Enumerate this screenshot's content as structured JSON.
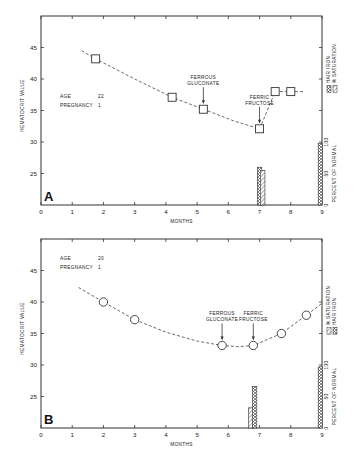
{
  "chart_data": [
    {
      "panel": "A",
      "type": "line",
      "xlabel": "MONTHS",
      "ylabel": "HEMATOCRIT VALUE",
      "y2label": "PERCENT OF NORMAL",
      "x_ticks": [
        "0",
        "1",
        "2",
        "3",
        "4",
        "5",
        "6",
        "7",
        "8",
        "9"
      ],
      "y_ticks": [
        "25",
        "30",
        "35",
        "40",
        "45"
      ],
      "y2_ticks": [
        "0",
        "50",
        "100"
      ],
      "xlim": [
        0,
        9
      ],
      "ylim": [
        20,
        50
      ],
      "y2lim": [
        0,
        100
      ],
      "marker": "square",
      "info": {
        "age_label": "AGE",
        "age_value": "22",
        "pregnancy_label": "PREGNANCY",
        "pregnancy_value": "1"
      },
      "series": [
        {
          "name": "Hematocrit",
          "x": [
            1.75,
            4.2,
            5.2,
            7.0,
            7.5,
            8.0
          ],
          "y": [
            43.2,
            37.1,
            35.2,
            32.1,
            38.0,
            38.0
          ]
        }
      ],
      "curve_path": [
        [
          1.3,
          44.5
        ],
        [
          1.75,
          43.2
        ],
        [
          3.0,
          40.0
        ],
        [
          4.2,
          37.1
        ],
        [
          5.2,
          35.2
        ],
        [
          6.2,
          33.3
        ],
        [
          7.0,
          32.1
        ],
        [
          7.5,
          38.0
        ],
        [
          8.0,
          38.0
        ],
        [
          8.4,
          38.0
        ]
      ],
      "annotations": [
        {
          "text_lines": [
            "FERROUS",
            "GLUCONATE"
          ],
          "x": 5.2,
          "y": 35.2
        },
        {
          "text_lines": [
            "FERRIC",
            "FRUCTOSE"
          ],
          "x": 7.0,
          "y": 32.1
        }
      ],
      "bars": [
        {
          "name": "HAIR IRON",
          "x": 7.0,
          "value": 60
        },
        {
          "name": "% SATURATION",
          "x": 7.1,
          "value": 55
        },
        {
          "name": "HAIR IRON",
          "x": 8.95,
          "value": 98
        }
      ],
      "legend": [
        "HAIR IRON",
        "% SATURATION"
      ],
      "grid": false
    },
    {
      "panel": "B",
      "type": "line",
      "xlabel": "MONTHS",
      "ylabel": "HEMATOCRIT VALUE",
      "y2label": "PERCENT OF NORMAL",
      "x_ticks": [
        "0",
        "1",
        "2",
        "3",
        "4",
        "5",
        "6",
        "7",
        "8",
        "9"
      ],
      "y_ticks": [
        "25",
        "30",
        "35",
        "40",
        "45"
      ],
      "y2_ticks": [
        "0",
        "50",
        "100"
      ],
      "xlim": [
        0,
        9
      ],
      "ylim": [
        20,
        50
      ],
      "y2lim": [
        0,
        100
      ],
      "marker": "circle",
      "info": {
        "age_label": "AGE",
        "age_value": "20",
        "pregnancy_label": "PREGNANCY",
        "pregnancy_value": "1"
      },
      "series": [
        {
          "name": "Hematocrit",
          "x": [
            2.0,
            3.0,
            5.8,
            6.8,
            7.7,
            8.5
          ],
          "y": [
            40.0,
            37.2,
            33.1,
            33.1,
            35.0,
            37.9
          ]
        }
      ],
      "curve_path": [
        [
          1.2,
          42.3
        ],
        [
          2.0,
          40.0
        ],
        [
          3.0,
          37.2
        ],
        [
          4.0,
          35.2
        ],
        [
          5.0,
          33.8
        ],
        [
          5.8,
          33.1
        ],
        [
          6.3,
          32.9
        ],
        [
          6.8,
          33.1
        ],
        [
          7.7,
          35.0
        ],
        [
          8.5,
          37.9
        ],
        [
          9.0,
          39.8
        ]
      ],
      "annotations": [
        {
          "text_lines": [
            "FERROUS",
            "GLUCONATE"
          ],
          "x": 5.8,
          "y": 33.1
        },
        {
          "text_lines": [
            "FERRIC",
            "FRUCTOSE"
          ],
          "x": 6.8,
          "y": 33.1
        }
      ],
      "bars": [
        {
          "name": "% SATURATION",
          "x": 6.72,
          "value": 32
        },
        {
          "name": "HAIR IRON",
          "x": 6.84,
          "value": 66
        },
        {
          "name": "HAIR IRON",
          "x": 8.95,
          "value": 97
        }
      ],
      "legend": [
        "% SATURATION",
        "HAIR IRON"
      ],
      "grid": false
    }
  ]
}
